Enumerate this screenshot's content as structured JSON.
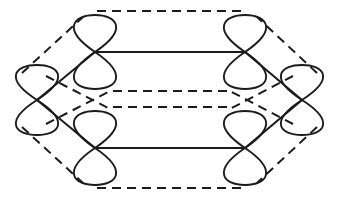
{
  "figure": {
    "caption": "",
    "background_color": "#ffffff",
    "stroke_color": "#1b1b1b",
    "canvas": {
      "width": 339,
      "height": 202
    }
  },
  "chart_data": {
    "type": "diagram",
    "xlabel": "",
    "ylabel": "",
    "grid": false,
    "legend": [],
    "annotations": [],
    "orbital_style": {
      "shape": "figure-eight",
      "orientation": "vertical",
      "lobe_count_each": 2,
      "stroke_width": 1.9,
      "fill": "none"
    },
    "line_styles": {
      "solid": {
        "name": "solid-bond",
        "stroke_width": 2.0,
        "dash": "none"
      },
      "dashed": {
        "name": "dashed-bond",
        "stroke_width": 2.0,
        "dash": "9 6"
      }
    },
    "nodes": [
      {
        "id": "left",
        "label": "left-vertex-orbital",
        "cx": 37,
        "cy": 100,
        "lobe_rx": 22,
        "lobe_ry": 35,
        "top_tip": 65,
        "bottom_tip": 135
      },
      {
        "id": "top-left",
        "label": "top-left-orbital",
        "cx": 95,
        "cy": 52,
        "lobe_rx": 22,
        "lobe_ry": 37,
        "top_tip": 15,
        "bottom_tip": 89
      },
      {
        "id": "top-right",
        "label": "top-right-orbital",
        "cx": 245,
        "cy": 52,
        "lobe_rx": 22,
        "lobe_ry": 37,
        "top_tip": 15,
        "bottom_tip": 89
      },
      {
        "id": "right",
        "label": "right-vertex-orbital",
        "cx": 302,
        "cy": 100,
        "lobe_rx": 22,
        "lobe_ry": 35,
        "top_tip": 65,
        "bottom_tip": 135
      },
      {
        "id": "bottom-right",
        "label": "bottom-right-orbital",
        "cx": 245,
        "cy": 148,
        "lobe_rx": 22,
        "lobe_ry": 37,
        "top_tip": 111,
        "bottom_tip": 185
      },
      {
        "id": "bottom-left",
        "label": "bottom-left-orbital",
        "cx": 95,
        "cy": 148,
        "lobe_rx": 22,
        "lobe_ry": 37,
        "top_tip": 111,
        "bottom_tip": 185
      }
    ],
    "solid_bonds": [
      {
        "id": "s-top",
        "label": "top-horizontal-bond",
        "x1": 95,
        "y1": 52,
        "x2": 245,
        "y2": 52
      },
      {
        "id": "s-bottom",
        "label": "bottom-horizontal-bond",
        "x1": 95,
        "y1": 148,
        "x2": 245,
        "y2": 148
      },
      {
        "id": "s-left-upper",
        "label": "left-upper-diagonal-bond",
        "x1": 37,
        "y1": 100,
        "x2": 95,
        "y2": 52
      },
      {
        "id": "s-left-lower",
        "label": "left-lower-diagonal-bond",
        "x1": 37,
        "y1": 100,
        "x2": 95,
        "y2": 148
      },
      {
        "id": "s-right-upper",
        "label": "right-upper-diagonal-bond",
        "x1": 302,
        "y1": 100,
        "x2": 245,
        "y2": 52
      },
      {
        "id": "s-right-lower",
        "label": "right-lower-diagonal-bond",
        "x1": 302,
        "y1": 100,
        "x2": 245,
        "y2": 148
      }
    ],
    "dashed_bonds": [
      {
        "id": "d-top",
        "label": "top-outer-dashed-bond",
        "x1": 97,
        "y1": 11,
        "x2": 243,
        "y2": 11
      },
      {
        "id": "d-bottom",
        "label": "bottom-outer-dashed-bond",
        "x1": 97,
        "y1": 188,
        "x2": 243,
        "y2": 188
      },
      {
        "id": "d-mid-upper",
        "label": "middle-upper-dashed-bond",
        "x1": 113,
        "y1": 91,
        "x2": 229,
        "y2": 91
      },
      {
        "id": "d-mid-lower",
        "label": "middle-lower-dashed-bond",
        "x1": 113,
        "y1": 107,
        "x2": 229,
        "y2": 107
      },
      {
        "id": "d-left-top",
        "label": "left-top-outer-dashed-bond",
        "x1": 22,
        "y1": 73,
        "x2": 83,
        "y2": 17
      },
      {
        "id": "d-left-bottom",
        "label": "left-bottom-outer-dashed",
        "x1": 22,
        "y1": 127,
        "x2": 83,
        "y2": 183
      },
      {
        "id": "d-right-top",
        "label": "right-top-outer-dashed-bond",
        "x1": 317,
        "y1": 73,
        "x2": 257,
        "y2": 17
      },
      {
        "id": "d-right-bottom",
        "label": "right-bottom-outer-dashed",
        "x1": 317,
        "y1": 127,
        "x2": 257,
        "y2": 183
      },
      {
        "id": "d-left-in-upper",
        "label": "left-inner-upper-dashed",
        "x1": 46,
        "y1": 76,
        "x2": 112,
        "y2": 110
      },
      {
        "id": "d-left-in-lower",
        "label": "left-inner-lower-dashed",
        "x1": 46,
        "y1": 124,
        "x2": 112,
        "y2": 90
      },
      {
        "id": "d-right-in-upper",
        "label": "right-inner-upper-dashed",
        "x1": 293,
        "y1": 76,
        "x2": 228,
        "y2": 110
      },
      {
        "id": "d-right-in-lower",
        "label": "right-inner-lower-dashed",
        "x1": 293,
        "y1": 124,
        "x2": 228,
        "y2": 90
      }
    ]
  }
}
